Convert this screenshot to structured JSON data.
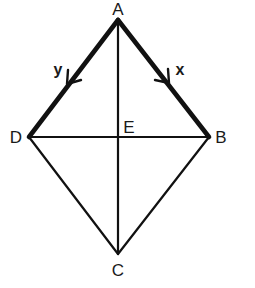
{
  "diagram": {
    "type": "geometry-rhombus",
    "points": {
      "A": {
        "label": "A",
        "x": 118,
        "y": 20
      },
      "B": {
        "label": "B",
        "x": 209,
        "y": 137
      },
      "C": {
        "label": "C",
        "x": 118,
        "y": 254
      },
      "D": {
        "label": "D",
        "x": 29,
        "y": 137
      },
      "E": {
        "label": "E",
        "x": 118,
        "y": 137
      }
    },
    "edges": [
      {
        "from": "A",
        "to": "D",
        "style": "bold",
        "vector": "y",
        "arrow_direction": "toward D"
      },
      {
        "from": "A",
        "to": "B",
        "style": "bold",
        "vector": "x",
        "arrow_direction": "toward B"
      },
      {
        "from": "D",
        "to": "C",
        "style": "thin"
      },
      {
        "from": "B",
        "to": "C",
        "style": "thin"
      },
      {
        "from": "A",
        "to": "C",
        "style": "thin",
        "note": "diagonal"
      },
      {
        "from": "D",
        "to": "B",
        "style": "thin",
        "note": "diagonal"
      }
    ],
    "labels": {
      "A": "A",
      "B": "B",
      "C": "C",
      "D": "D",
      "E": "E",
      "x": "x",
      "y": "y"
    },
    "colors": {
      "stroke": "#111111",
      "text": "#1a1a1a",
      "background": "#ffffff"
    }
  }
}
